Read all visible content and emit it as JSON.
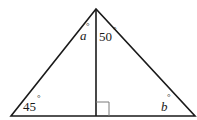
{
  "diagram": {
    "type": "triangle-with-altitude",
    "colors": {
      "stroke": "#1a1a1a",
      "right_angle_mark": "#7a7a7a",
      "background": "#ffffff"
    },
    "vertices": {
      "apex": [
        96,
        9
      ],
      "left_base": [
        11,
        116
      ],
      "right_base": [
        195,
        116
      ],
      "altitude_foot": [
        96,
        116
      ]
    },
    "labels": {
      "angle_a": {
        "text": "a",
        "degree": "°"
      },
      "angle_50": {
        "text": "50",
        "degree": "°"
      },
      "angle_45": {
        "text": "45",
        "degree": "°"
      },
      "angle_b": {
        "text": "b",
        "degree": "°"
      }
    },
    "right_angle_marker": true
  }
}
